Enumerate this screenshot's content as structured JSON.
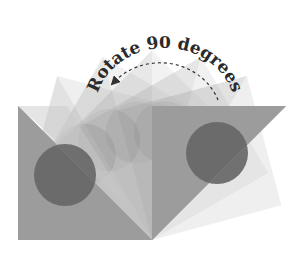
{
  "diagram": {
    "caption": "Rotate 90 degrees",
    "pivot": {
      "x": 152,
      "y": 240
    },
    "square_side": 134,
    "rotation_total_deg": 90,
    "rotation_step_deg": 15,
    "steps": [
      0,
      15,
      30,
      45,
      60,
      75,
      90
    ],
    "colors": {
      "light_triangle": "#c9c9c9",
      "dark_triangle": "#9a9a9a",
      "circle": "#6b6b6b",
      "arrow": "#333333",
      "caption": "#2a2a2a"
    },
    "arrow": {
      "style": "dashed",
      "direction": "counterclockwise"
    }
  }
}
